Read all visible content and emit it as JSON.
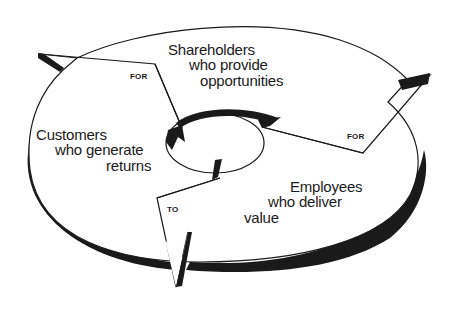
{
  "diagram": {
    "type": "cycle",
    "colors": {
      "stroke": "#1a1a1a",
      "fill": "#ffffff",
      "shadow": "#1a1a1a"
    },
    "nodes": [
      {
        "id": "shareholders",
        "lines": [
          "Shareholders",
          "who provide",
          "opportunities"
        ]
      },
      {
        "id": "employees",
        "lines": [
          "Employees",
          "who deliver",
          "value"
        ]
      },
      {
        "id": "customers",
        "lines": [
          "Customers",
          "who generate",
          "returns"
        ]
      }
    ],
    "connectors": [
      {
        "from": "shareholders",
        "to": "employees",
        "label": "FOR"
      },
      {
        "from": "employees",
        "to": "customers",
        "label": "TO"
      },
      {
        "from": "customers",
        "to": "shareholders",
        "label": "FOR"
      }
    ]
  }
}
